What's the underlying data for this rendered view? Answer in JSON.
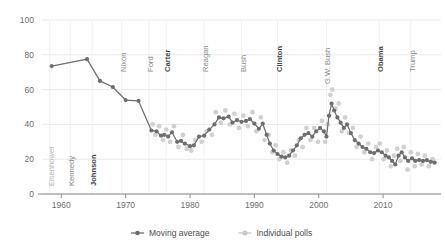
{
  "chart_data": {
    "type": "line",
    "title": "",
    "subtitle": "",
    "xlabel": "",
    "ylabel": "",
    "xlim": [
      1957,
      2019
    ],
    "ylim": [
      0,
      100
    ],
    "grid": true,
    "legend_position": "bottom-center",
    "x_ticks": [
      "1960",
      "1970",
      "1980",
      "1990",
      "2000",
      "2010"
    ],
    "x_tick_values": [
      1960,
      1970,
      1980,
      1990,
      2000,
      2010
    ],
    "y_ticks": [
      "0",
      "20",
      "40",
      "60",
      "80",
      "100"
    ],
    "y_tick_values": [
      0,
      20,
      40,
      60,
      80,
      100
    ],
    "series": [
      {
        "name": "Moving average",
        "style": "line-markers",
        "color": "#6e6e6e",
        "points": [
          [
            1958.5,
            73.5
          ],
          [
            1964.0,
            77.5
          ],
          [
            1966.0,
            65.0
          ],
          [
            1968.0,
            61.5
          ],
          [
            1970.0,
            54.0
          ],
          [
            1972.0,
            53.5
          ],
          [
            1974.0,
            36.5
          ],
          [
            1974.8,
            36.0
          ],
          [
            1975.5,
            33.5
          ],
          [
            1976.0,
            34.0
          ],
          [
            1976.6,
            33.0
          ],
          [
            1977.2,
            35.5
          ],
          [
            1978.0,
            30.0
          ],
          [
            1978.6,
            30.5
          ],
          [
            1979.2,
            29.0
          ],
          [
            1980.0,
            27.5
          ],
          [
            1980.6,
            28.0
          ],
          [
            1981.4,
            33.0
          ],
          [
            1982.2,
            33.5
          ],
          [
            1983.0,
            37.0
          ],
          [
            1983.8,
            40.0
          ],
          [
            1984.5,
            44.0
          ],
          [
            1985.2,
            43.5
          ],
          [
            1986.0,
            44.5
          ],
          [
            1986.6,
            41.0
          ],
          [
            1987.3,
            42.5
          ],
          [
            1988.0,
            41.5
          ],
          [
            1988.7,
            42.0
          ],
          [
            1989.3,
            43.0
          ],
          [
            1990.0,
            40.5
          ],
          [
            1990.7,
            37.5
          ],
          [
            1991.3,
            40.5
          ],
          [
            1991.9,
            34.0
          ],
          [
            1992.4,
            29.0
          ],
          [
            1993.0,
            25.0
          ],
          [
            1993.6,
            23.0
          ],
          [
            1994.2,
            21.5
          ],
          [
            1994.8,
            21.0
          ],
          [
            1995.4,
            22.0
          ],
          [
            1996.0,
            25.0
          ],
          [
            1996.6,
            28.0
          ],
          [
            1997.2,
            32.0
          ],
          [
            1997.8,
            34.0
          ],
          [
            1998.4,
            35.0
          ],
          [
            1999.0,
            33.0
          ],
          [
            1999.6,
            36.0
          ],
          [
            2000.2,
            38.0
          ],
          [
            2000.8,
            36.0
          ],
          [
            2001.2,
            33.0
          ],
          [
            2001.6,
            45.0
          ],
          [
            2002.0,
            52.0
          ],
          [
            2002.4,
            48.0
          ],
          [
            2002.9,
            44.0
          ],
          [
            2003.4,
            41.0
          ],
          [
            2003.9,
            38.0
          ],
          [
            2004.4,
            40.0
          ],
          [
            2005.0,
            35.0
          ],
          [
            2005.6,
            31.0
          ],
          [
            2006.2,
            29.0
          ],
          [
            2006.8,
            27.0
          ],
          [
            2007.4,
            26.0
          ],
          [
            2008.0,
            24.0
          ],
          [
            2008.6,
            23.5
          ],
          [
            2009.2,
            25.0
          ],
          [
            2009.8,
            24.0
          ],
          [
            2010.4,
            22.0
          ],
          [
            2010.9,
            21.0
          ],
          [
            2011.4,
            19.0
          ],
          [
            2011.9,
            17.0
          ],
          [
            2012.4,
            22.0
          ],
          [
            2012.9,
            24.0
          ],
          [
            2013.4,
            21.0
          ],
          [
            2013.9,
            19.0
          ],
          [
            2014.5,
            20.5
          ],
          [
            2015.0,
            19.0
          ],
          [
            2015.6,
            19.5
          ],
          [
            2016.2,
            19.0
          ],
          [
            2016.8,
            19.5
          ],
          [
            2017.4,
            18.5
          ],
          [
            2018.0,
            18.0
          ]
        ]
      },
      {
        "name": "Individual polls",
        "style": "scatter",
        "color": "#c9c9c9",
        "points": [
          [
            1974.2,
            40.0
          ],
          [
            1974.6,
            34.0
          ],
          [
            1975.2,
            39.0
          ],
          [
            1975.8,
            31.0
          ],
          [
            1976.3,
            37.0
          ],
          [
            1976.9,
            30.0
          ],
          [
            1977.5,
            39.0
          ],
          [
            1978.2,
            27.0
          ],
          [
            1978.9,
            34.0
          ],
          [
            1979.5,
            26.0
          ],
          [
            1980.2,
            25.0
          ],
          [
            1980.8,
            31.0
          ],
          [
            1981.8,
            30.0
          ],
          [
            1982.6,
            36.0
          ],
          [
            1983.4,
            34.0
          ],
          [
            1984.0,
            47.0
          ],
          [
            1984.8,
            41.0
          ],
          [
            1985.5,
            48.0
          ],
          [
            1986.2,
            40.0
          ],
          [
            1986.9,
            46.0
          ],
          [
            1987.6,
            38.0
          ],
          [
            1988.3,
            45.0
          ],
          [
            1989.0,
            39.0
          ],
          [
            1989.7,
            47.0
          ],
          [
            1990.3,
            36.0
          ],
          [
            1991.0,
            44.0
          ],
          [
            1991.6,
            31.0
          ],
          [
            1992.2,
            34.0
          ],
          [
            1992.8,
            24.0
          ],
          [
            1993.3,
            28.0
          ],
          [
            1993.9,
            20.0
          ],
          [
            1994.5,
            24.0
          ],
          [
            1995.1,
            18.0
          ],
          [
            1995.7,
            25.0
          ],
          [
            1996.3,
            22.0
          ],
          [
            1996.9,
            31.0
          ],
          [
            1997.5,
            27.0
          ],
          [
            1998.1,
            38.0
          ],
          [
            1998.7,
            31.0
          ],
          [
            1999.3,
            38.0
          ],
          [
            1999.9,
            30.0
          ],
          [
            2000.5,
            42.0
          ],
          [
            2001.0,
            30.0
          ],
          [
            2001.4,
            40.0
          ],
          [
            2001.8,
            57.0
          ],
          [
            2002.1,
            60.0
          ],
          [
            2002.6,
            49.0
          ],
          [
            2003.1,
            52.0
          ],
          [
            2003.6,
            36.0
          ],
          [
            2004.1,
            44.0
          ],
          [
            2004.7,
            35.0
          ],
          [
            2005.3,
            38.0
          ],
          [
            2005.9,
            27.0
          ],
          [
            2006.5,
            33.0
          ],
          [
            2007.1,
            24.0
          ],
          [
            2007.7,
            29.0
          ],
          [
            2008.3,
            20.0
          ],
          [
            2008.9,
            27.0
          ],
          [
            2009.5,
            29.0
          ],
          [
            2010.1,
            20.0
          ],
          [
            2010.6,
            25.0
          ],
          [
            2011.2,
            16.0
          ],
          [
            2011.7,
            22.0
          ],
          [
            2012.2,
            26.0
          ],
          [
            2012.7,
            19.0
          ],
          [
            2013.2,
            27.0
          ],
          [
            2013.8,
            14.0
          ],
          [
            2014.3,
            24.0
          ],
          [
            2014.9,
            16.0
          ],
          [
            2015.4,
            23.0
          ],
          [
            2016.0,
            17.0
          ],
          [
            2016.5,
            22.0
          ],
          [
            2017.1,
            16.0
          ],
          [
            2017.7,
            20.0
          ]
        ]
      }
    ],
    "president_markers": [
      {
        "label": "Eisenhower",
        "year": 1958.2,
        "emphasis": "dim"
      },
      {
        "label": "Kennedy",
        "year": 1961.4,
        "emphasis": "mid"
      },
      {
        "label": "Johnson",
        "year": 1964.8,
        "emphasis": "dark"
      },
      {
        "label": "Nixon",
        "year": 1969.4,
        "emphasis": "mid"
      },
      {
        "label": "Ford",
        "year": 1973.6,
        "emphasis": "mid"
      },
      {
        "label": "Carter",
        "year": 1976.3,
        "emphasis": "dark"
      },
      {
        "label": "Reagan",
        "year": 1982.2,
        "emphasis": "mid"
      },
      {
        "label": "Bush",
        "year": 1988.0,
        "emphasis": "mid"
      },
      {
        "label": "Clinton",
        "year": 1993.6,
        "emphasis": "dark"
      },
      {
        "label": "G.W. Bush",
        "year": 2001.2,
        "emphasis": "mid"
      },
      {
        "label": "Obama",
        "year": 2009.4,
        "emphasis": "dark"
      },
      {
        "label": "Trump",
        "year": 2014.3,
        "emphasis": "mid"
      }
    ]
  },
  "legend": {
    "items": [
      {
        "label": "Moving average",
        "marker": "line-dot-marker",
        "color": "#6e6e6e"
      },
      {
        "label": "Individual polls",
        "marker": "dot-marker",
        "color": "#c9c9c9"
      }
    ]
  }
}
